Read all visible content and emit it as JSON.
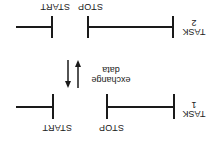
{
  "diagram": {
    "orientation": "rotated 180 degrees",
    "tasks": [
      {
        "id": "task1",
        "label_line1": "TASK",
        "label_line2": "1",
        "stop_label": "STOP",
        "start_label": "START"
      },
      {
        "id": "task2",
        "label_line1": "TASK",
        "label_line2": "2",
        "stop_label": "STOP",
        "start_label": "START"
      }
    ],
    "exchange": {
      "line1": "exchange",
      "line2": "data"
    },
    "colors": {
      "ink": "#1a1a1a",
      "background": "#ffffff"
    }
  }
}
